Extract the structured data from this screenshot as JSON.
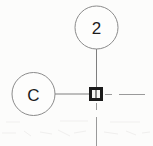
{
  "drawing": {
    "title": "CAD detail callout",
    "background_color": "#fcfcfb",
    "line_color": "#7e7e7e",
    "centerline_color": "#9a9a9a",
    "marker_color": "#1a1a1a",
    "text_color": "#1c1c1c",
    "width": 153,
    "height": 146
  },
  "balloons": [
    {
      "label": "2",
      "name": "balloon-callout-2",
      "cx": 96.5,
      "cy": 27.5,
      "r": 21.5
    },
    {
      "label": "C",
      "name": "balloon-callout-c",
      "cx": 33.5,
      "cy": 94,
      "r": 21.5
    }
  ],
  "leaders": [
    {
      "name": "leader-line-vertical",
      "from_x": 96.5,
      "from_y": 49,
      "to_x": 96.5,
      "to_y": 88
    },
    {
      "name": "leader-line-horizontal",
      "from_x": 55,
      "from_y": 94,
      "to_x": 89,
      "to_y": 94
    }
  ],
  "node": {
    "name": "square-node-marker",
    "x": 89,
    "y": 87,
    "size": 14,
    "border": 3
  },
  "centerlines": [
    {
      "name": "centerline-right",
      "orientation": "horizontal",
      "x1": 104,
      "y1": 94,
      "x2": 152,
      "y2": 94,
      "dash": "7 5 22 0"
    },
    {
      "name": "centerline-down",
      "orientation": "vertical",
      "x1": 96.5,
      "y1": 102,
      "x2": 96.5,
      "y2": 146,
      "dash": "7 6 30 0"
    }
  ],
  "artifacts": {
    "name": "scan-artifact-band",
    "visible": true
  }
}
